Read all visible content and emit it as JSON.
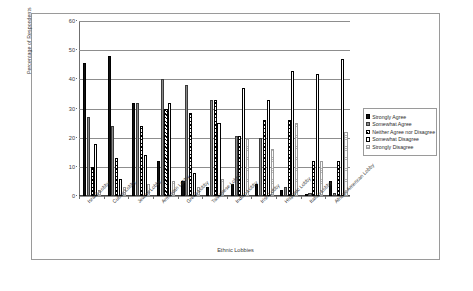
{
  "chart_data": {
    "type": "bar",
    "title": "",
    "xlabel": "Ethnic Lobbies",
    "ylabel": "Percentage of Respondents",
    "ylim": [
      0,
      60
    ],
    "yticks": [
      0,
      10,
      20,
      30,
      40,
      50,
      60
    ],
    "grid": true,
    "legend_position": "right",
    "categories": [
      "Israeli Lobby",
      "Cuban Lobby",
      "Jewish Lobby",
      "Armenian Lobby",
      "Greek  Lobby",
      "Taiwanese Lobby",
      "Indian Lobby",
      "Irish Lobby",
      "Hispanic Lobby",
      "Italian Lobby",
      "African American Lobby"
    ],
    "series": [
      {
        "name": "Strongly Agree",
        "values": [
          45.5,
          48.0,
          32.0,
          12.0,
          5.0,
          3.0,
          4.0,
          4.0,
          2.0,
          0.8,
          5.0
        ]
      },
      {
        "name": "Somewhat Agree",
        "values": [
          27.0,
          24.0,
          32.0,
          40.0,
          38.0,
          33.0,
          20.5,
          20.0,
          3.0,
          1.0,
          1.0
        ]
      },
      {
        "name": "Neither Agree nor Disagree",
        "values": [
          10.0,
          13.0,
          24.0,
          30.0,
          28.5,
          33.0,
          20.5,
          26.0,
          26.0,
          12.0,
          12.0
        ]
      },
      {
        "name": "Somewhat Disagree",
        "values": [
          18.0,
          6.0,
          14.0,
          32.0,
          8.0,
          25.0,
          37.0,
          33.0,
          43.0,
          42.0,
          47.0
        ]
      },
      {
        "name": "Strongly Disagree",
        "values": [
          2.0,
          3.0,
          4.0,
          5.0,
          3.0,
          6.0,
          20.0,
          16.0,
          25.0,
          12.0,
          22.0
        ]
      }
    ]
  },
  "legend": {
    "items": [
      {
        "label": "Strongly Agree",
        "swatch": "solid-black"
      },
      {
        "label": "Somewhat Agree",
        "swatch": "solid-gray"
      },
      {
        "label": "Neither Agree nor Disagree",
        "swatch": "diagonal-hatch"
      },
      {
        "label": "Somewhat Disagree",
        "swatch": "white-outline"
      },
      {
        "label": "Strongly Disagree",
        "swatch": "dotted-light"
      }
    ]
  }
}
